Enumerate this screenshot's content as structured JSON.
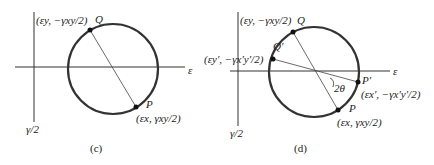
{
  "panel_c": {
    "caption": "(c)",
    "axis_x_label": "ε",
    "axis_y_label": "γ/2",
    "point_Q": {
      "name": "Q",
      "label": "(εy, −γxy/2)"
    },
    "point_P": {
      "name": "P",
      "label": "(εx, γxy/2)"
    }
  },
  "panel_d": {
    "caption": "(d)",
    "axis_x_label": "ε",
    "axis_y_label": "γ/2",
    "point_Q": {
      "name": "Q",
      "label": "(εy, −γxy/2)"
    },
    "point_Qp": {
      "name": "Q′",
      "label": "(εy′, −γx′y′/2)"
    },
    "point_P": {
      "name": "P",
      "label": "(εx, γxy/2)"
    },
    "point_Pp": {
      "name": "P′",
      "label": "(εx′, −γx′y′/2)"
    },
    "angle_label": "2θ"
  }
}
